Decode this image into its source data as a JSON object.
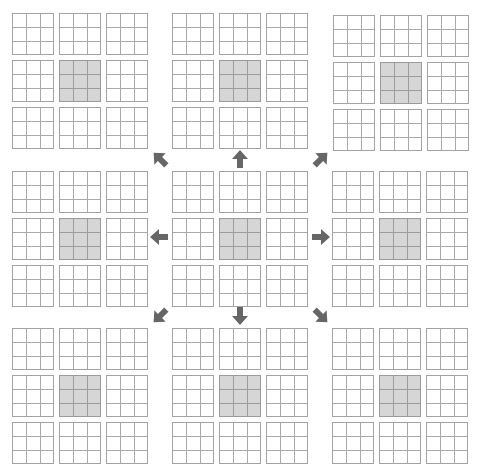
{
  "diagram": {
    "colors": {
      "grid_line": "#a3a3a3",
      "shaded_fill": "#d6d6d6",
      "arrow": "#666666",
      "background": "#ffffff"
    },
    "blocks": [
      {
        "id": "top-left",
        "row": 0,
        "col": 0,
        "x": 12,
        "y": 13
      },
      {
        "id": "top-center",
        "row": 0,
        "col": 1,
        "x": 172,
        "y": 13
      },
      {
        "id": "top-right",
        "row": 0,
        "col": 2,
        "x": 333,
        "y": 15
      },
      {
        "id": "middle-left",
        "row": 1,
        "col": 0,
        "x": 12,
        "y": 171
      },
      {
        "id": "center",
        "row": 1,
        "col": 1,
        "x": 172,
        "y": 171
      },
      {
        "id": "middle-right",
        "row": 1,
        "col": 2,
        "x": 332,
        "y": 171
      },
      {
        "id": "bottom-left",
        "row": 2,
        "col": 0,
        "x": 12,
        "y": 328
      },
      {
        "id": "bottom-center",
        "row": 2,
        "col": 1,
        "x": 172,
        "y": 328
      },
      {
        "id": "bottom-right",
        "row": 2,
        "col": 2,
        "x": 332,
        "y": 328
      }
    ],
    "grid_size": 3,
    "subgrid_size": 3,
    "shaded_position": "center",
    "arrows": [
      {
        "direction": "up-left",
        "angle": -135,
        "x": 150,
        "y": 149
      },
      {
        "direction": "up",
        "angle": -90,
        "x": 230,
        "y": 149
      },
      {
        "direction": "up-right",
        "angle": -45,
        "x": 311,
        "y": 149
      },
      {
        "direction": "left",
        "angle": 180,
        "x": 149,
        "y": 227
      },
      {
        "direction": "right",
        "angle": 0,
        "x": 311,
        "y": 227
      },
      {
        "direction": "down-left",
        "angle": 135,
        "x": 150,
        "y": 306
      },
      {
        "direction": "down",
        "angle": 90,
        "x": 230,
        "y": 306
      },
      {
        "direction": "down-right",
        "angle": 45,
        "x": 311,
        "y": 306
      }
    ]
  }
}
